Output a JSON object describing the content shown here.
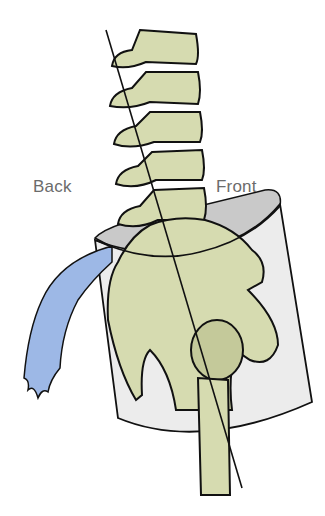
{
  "diagram": {
    "type": "anatomical-illustration",
    "labels": {
      "back": "Back",
      "front": "Front"
    },
    "colors": {
      "bone": "#d6dbb0",
      "bone_shadow": "#c4c99a",
      "bucket": "#ececec",
      "bucket_inner": "#c9c9c9",
      "water": "#9db8e6",
      "outline": "#111111",
      "label": "#6b6b6b"
    }
  }
}
